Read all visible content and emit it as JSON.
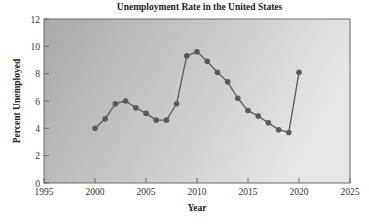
{
  "chart_data": {
    "type": "line",
    "title": "Unemployment Rate in the United States",
    "xlabel": "Year",
    "ylabel": "Percent Unemployed",
    "xlim": [
      1995,
      2025
    ],
    "ylim": [
      0,
      12
    ],
    "x_ticks": [
      1995,
      2000,
      2005,
      2010,
      2015,
      2020,
      2025
    ],
    "y_ticks": [
      0,
      2,
      4,
      6,
      8,
      10,
      12
    ],
    "grid": false,
    "legend": null,
    "series": [
      {
        "name": "Unemployment Rate",
        "x": [
          2000,
          2001,
          2002,
          2003,
          2004,
          2005,
          2006,
          2007,
          2008,
          2009,
          2010,
          2011,
          2012,
          2013,
          2014,
          2015,
          2016,
          2017,
          2018,
          2019,
          2020
        ],
        "values": [
          4.0,
          4.7,
          5.8,
          6.0,
          5.5,
          5.1,
          4.6,
          4.6,
          5.8,
          9.3,
          9.6,
          8.9,
          8.1,
          7.4,
          6.2,
          5.3,
          4.9,
          4.4,
          3.9,
          3.7,
          8.1
        ],
        "color": "#5a5a5a",
        "marker": "circle"
      }
    ]
  },
  "colors": {
    "plot_bg_left": "#a9a9a9",
    "plot_bg_right": "#e6e6e6",
    "line": "#5a5a5a",
    "frame": "#6a6a6a"
  }
}
